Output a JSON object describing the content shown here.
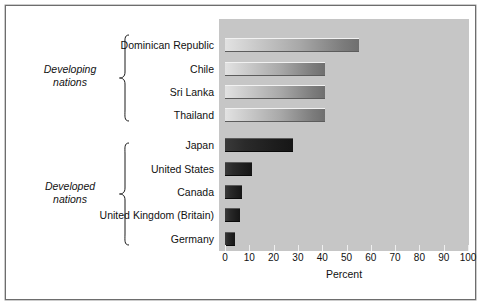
{
  "figure": {
    "background_color": "#ffffff",
    "plot_background_color": "#c6c6c6",
    "border_color": "#6d6d6d"
  },
  "groups": [
    {
      "id": "developing",
      "label": "Developing\nnations",
      "brace_icon": "curly-brace-icon",
      "members": [
        "Dominican Republic",
        "Chile",
        "Sri Lanka",
        "Thailand"
      ]
    },
    {
      "id": "developed",
      "label": "Developed\nnations",
      "brace_icon": "curly-brace-icon",
      "members": [
        "Japan",
        "United States",
        "Canada",
        "United Kingdom (Britain)",
        "Germany"
      ]
    }
  ],
  "axis": {
    "xlabel": "Percent",
    "ticks": [
      "0",
      "10",
      "20",
      "30",
      "40",
      "50",
      "60",
      "70",
      "80",
      "90",
      "100"
    ],
    "xlim": [
      0,
      100
    ]
  },
  "chart_data": {
    "type": "bar",
    "orientation": "horizontal",
    "title": "",
    "subtitle": "",
    "xlabel": "Percent",
    "ylabel": "",
    "xlim": [
      0,
      100
    ],
    "xticks": [
      0,
      10,
      20,
      30,
      40,
      50,
      60,
      70,
      80,
      90,
      100
    ],
    "grid": false,
    "legend": null,
    "categories": [
      "Dominican Republic",
      "Chile",
      "Sri Lanka",
      "Thailand",
      "Japan",
      "United States",
      "Canada",
      "United Kingdom (Britain)",
      "Germany"
    ],
    "values": [
      55,
      41,
      41,
      41,
      28,
      11,
      7,
      6,
      4
    ],
    "groups": {
      "Developing nations": [
        "Dominican Republic",
        "Chile",
        "Sri Lanka",
        "Thailand"
      ],
      "Developed nations": [
        "Japan",
        "United States",
        "Canada",
        "United Kingdom (Britain)",
        "Germany"
      ]
    },
    "bar_styles": [
      "light",
      "light",
      "light",
      "light",
      "dark",
      "dark",
      "dark",
      "dark",
      "dark"
    ],
    "annotations": [
      "Developing nations",
      "Developed nations"
    ]
  },
  "bars": [
    {
      "label": "Dominican Republic",
      "value": 55,
      "style": "light",
      "top": 19
    },
    {
      "label": "Chile",
      "value": 41,
      "style": "light",
      "top": 43
    },
    {
      "label": "Sri Lanka",
      "value": 41,
      "style": "light",
      "top": 66
    },
    {
      "label": "Thailand",
      "value": 41,
      "style": "light",
      "top": 89
    },
    {
      "label": "Japan",
      "value": 28,
      "style": "dark",
      "top": 119
    },
    {
      "label": "United States",
      "value": 11,
      "style": "dark",
      "top": 143
    },
    {
      "label": "Canada",
      "value": 7,
      "style": "dark",
      "top": 166
    },
    {
      "label": "United Kingdom (Britain)",
      "value": 6,
      "style": "dark",
      "top": 189
    },
    {
      "label": "Germany",
      "value": 4,
      "style": "dark",
      "top": 213
    }
  ]
}
